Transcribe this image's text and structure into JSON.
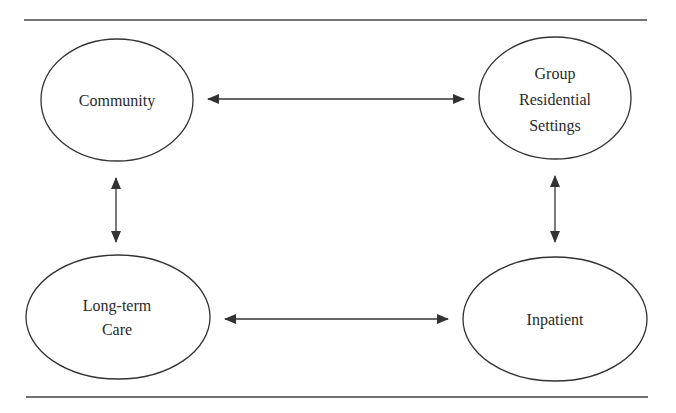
{
  "diagram": {
    "colors": {
      "stroke": "#333333",
      "text": "#2a2a2a",
      "background": "#ffffff"
    },
    "nodes": [
      {
        "id": "community",
        "lines": [
          "Community"
        ]
      },
      {
        "id": "group_residential",
        "lines": [
          "Group",
          "Residential",
          "Settings"
        ]
      },
      {
        "id": "long_term_care",
        "lines": [
          "Long-term",
          "Care"
        ]
      },
      {
        "id": "inpatient",
        "lines": [
          "Inpatient"
        ]
      }
    ],
    "edges": [
      {
        "from": "Community",
        "to": "Group Residential Settings",
        "direction": "bidirectional"
      },
      {
        "from": "Community",
        "to": "Long-term Care",
        "direction": "bidirectional"
      },
      {
        "from": "Group Residential Settings",
        "to": "Inpatient",
        "direction": "bidirectional"
      },
      {
        "from": "Long-term Care",
        "to": "Inpatient",
        "direction": "bidirectional"
      }
    ]
  }
}
